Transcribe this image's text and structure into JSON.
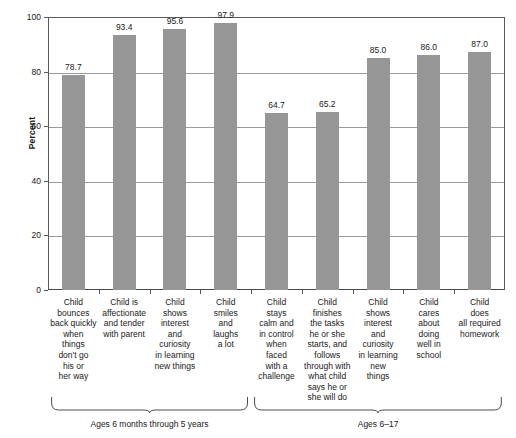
{
  "chart_data": {
    "type": "bar",
    "title": "",
    "subtitle": "",
    "xlabel": "",
    "ylabel": "Percent",
    "ylim": [
      0,
      100
    ],
    "yticks": [
      0,
      20,
      40,
      60,
      80,
      100
    ],
    "ytick_labels": [
      "0",
      "20",
      "40",
      "60",
      "80",
      "100"
    ],
    "grid": true,
    "legend": false,
    "bar_color": "#969696",
    "categories": [
      "Child bounces back quickly when things don't go his or her way",
      "Child is affectionate and tender with parent",
      "Child shows interest and curiosity in learning new things",
      "Child smiles and laughs a lot",
      "Child stays calm and in control when faced with a challenge",
      "Child finishes the tasks he or she starts, and follows through with what child says he or she will do",
      "Child shows interest and curiosity in learning new things",
      "Child cares about doing well in school",
      "Child does all required homework"
    ],
    "values": [
      78.7,
      93.4,
      95.6,
      97.9,
      64.7,
      65.2,
      85.0,
      86.0,
      87.0
    ],
    "value_labels": [
      "78.7",
      "93.4",
      "95.6",
      "97.9",
      "64.7",
      "65.2",
      "85.0",
      "86.0",
      "87.0"
    ],
    "groups": [
      {
        "label": "Ages 6 months through 5 years",
        "start": 0,
        "end": 3
      },
      {
        "label": "Ages 6–17",
        "start": 4,
        "end": 8
      }
    ]
  },
  "category_lines": [
    [
      "Child",
      "bounces",
      "back quickly",
      "when",
      "things",
      "don't go",
      "his or",
      "her way"
    ],
    [
      "Child is",
      "affectionate",
      "and tender",
      "with parent"
    ],
    [
      "Child",
      "shows",
      "interest",
      "and",
      "curiosity",
      "in learning",
      "new things"
    ],
    [
      "Child",
      "smiles",
      "and",
      "laughs",
      "a lot"
    ],
    [
      "Child",
      "stays",
      "calm and",
      "in control",
      "when",
      "faced",
      "with a",
      "challenge"
    ],
    [
      "Child",
      "finishes",
      "the tasks",
      "he or she",
      "starts, and",
      "follows",
      "through with",
      "what child",
      "says he or",
      "she will do"
    ],
    [
      "Child",
      "shows",
      "interest",
      "and",
      "curiosity",
      "in learning",
      "new",
      "things"
    ],
    [
      "Child",
      "cares",
      "about",
      "doing",
      "well in",
      "school"
    ],
    [
      "Child",
      "does",
      "all required",
      "homework"
    ]
  ]
}
